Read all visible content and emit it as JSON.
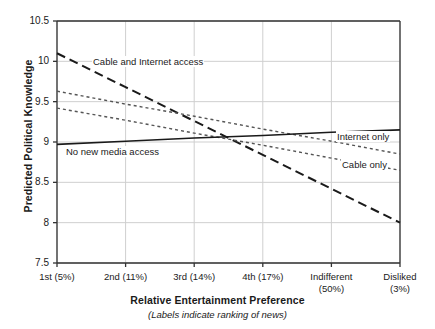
{
  "chart_data": {
    "type": "line",
    "title": "",
    "xlabel": "Relative Entertainment Preference",
    "xlabel_note": "(Labels indicate ranking of news)",
    "ylabel": "Predicted Political Knowledge",
    "ylim": [
      7.5,
      10.5
    ],
    "yticks": [
      "7.5",
      "8",
      "8.5",
      "9",
      "9.5",
      "10",
      "10.5"
    ],
    "ytick_values": [
      7.5,
      8,
      8.5,
      9,
      9.5,
      10,
      10.5
    ],
    "grid": true,
    "legend_position": "inline-annotations",
    "categories": [
      "1st (5%)",
      "2nd (11%)",
      "3rd (14%)",
      "4th (17%)",
      "Indifferent (50%)",
      "Disliked (3%)"
    ],
    "category_lines": [
      [
        "1st (5%)"
      ],
      [
        "2nd (11%)"
      ],
      [
        "3rd (14%)"
      ],
      [
        "4th (17%)"
      ],
      [
        "Indifferent",
        "(50%)"
      ],
      [
        "Disliked",
        "(3%)"
      ]
    ],
    "series": [
      {
        "name": "Cable and Internet access",
        "style": "long-dashed",
        "color": "#1a1a1a",
        "values": [
          10.1,
          9.68,
          9.26,
          8.84,
          8.42,
          8.0
        ]
      },
      {
        "name": "Internet only",
        "style": "dotted",
        "color": "#555555",
        "values": [
          9.63,
          9.47,
          9.32,
          9.16,
          9.01,
          8.85
        ]
      },
      {
        "name": "Cable only",
        "style": "dotted",
        "color": "#555555",
        "values": [
          9.42,
          9.27,
          9.11,
          8.96,
          8.8,
          8.65
        ]
      },
      {
        "name": "No new media access",
        "style": "solid",
        "color": "#1a1a1a",
        "values": [
          8.97,
          9.01,
          9.05,
          9.08,
          9.12,
          9.15
        ]
      }
    ],
    "annotations": [
      {
        "id": "cable-internet",
        "text": "Cable and Internet access"
      },
      {
        "id": "no-new-media",
        "text": "No new media access"
      },
      {
        "id": "internet-only",
        "text": "Internet only"
      },
      {
        "id": "cable-only",
        "text": "Cable only"
      }
    ],
    "colors": {
      "axis": "#333333",
      "grid": "#cfcfcf",
      "text": "#1a1a1a",
      "background": "#ffffff"
    }
  }
}
